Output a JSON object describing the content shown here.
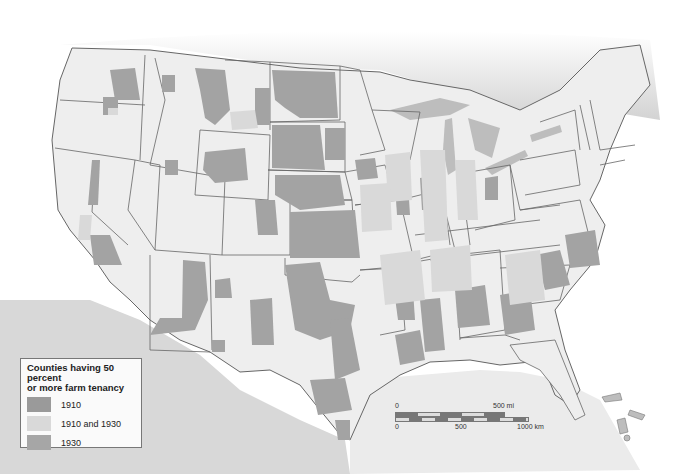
{
  "map": {
    "subject": "United States farm tenancy by county",
    "colors": {
      "background": "#ffffff",
      "neighbor_land": "#d2d2d2",
      "water": "#bcbcbc",
      "state_fill": "#eeeeee",
      "state_border": "#666666",
      "tenancy_1910": "#9a9a9a",
      "tenancy_1910_and_1930": "#d9d9d9",
      "tenancy_1930": "#a6a6a6"
    }
  },
  "legend": {
    "title": "Counties having 50 percent or more farm tenancy",
    "title_line1": "Counties having 50 percent",
    "title_line2": "or more farm tenancy",
    "items": [
      {
        "label": "1910",
        "color": "#9a9a9a"
      },
      {
        "label": "1910 and 1930",
        "color": "#d9d9d9"
      },
      {
        "label": "1930",
        "color": "#a6a6a6"
      }
    ]
  },
  "scale_bar": {
    "miles": {
      "start": "0",
      "end": "500 mi"
    },
    "km": {
      "start": "0",
      "mid": "500",
      "end": "1000 km"
    }
  }
}
